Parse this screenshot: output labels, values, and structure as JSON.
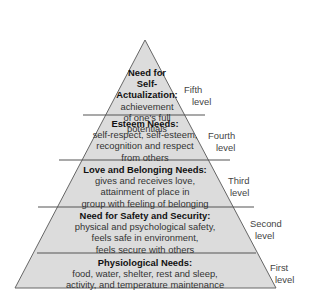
{
  "diagram": {
    "type": "pyramid",
    "fill_color": "#dcdcdc",
    "line_color": "#555555",
    "levels": [
      {
        "title": "Need for Self-Actualization:",
        "title_lines": [
          "Need for",
          "Self-",
          "Actualization:"
        ],
        "desc_lines": [
          "achievement",
          "of one's full",
          "potentials"
        ],
        "level_label": [
          "Fifth",
          "level"
        ]
      },
      {
        "title": "Esteem Needs:",
        "desc_lines": [
          "self-respect, self-esteem,",
          "recognition and respect",
          "from others"
        ],
        "level_label": [
          "Fourth",
          "level"
        ]
      },
      {
        "title": "Love and Belonging Needs:",
        "desc_lines": [
          "gives and receives love,",
          "attainment of place in",
          "group with feeling of belonging"
        ],
        "level_label": [
          "Third",
          "level"
        ]
      },
      {
        "title": "Need for Safety and Security:",
        "desc_lines": [
          "physical and psychological safety,",
          "feels safe in environment,",
          "feels secure with others"
        ],
        "level_label": [
          "Second",
          "level"
        ]
      },
      {
        "title": "Physiological Needs:",
        "desc_lines": [
          "food, water, shelter, rest and sleep,",
          "activity, and temperature maintenance"
        ],
        "level_label": [
          "First",
          "level"
        ]
      }
    ]
  }
}
